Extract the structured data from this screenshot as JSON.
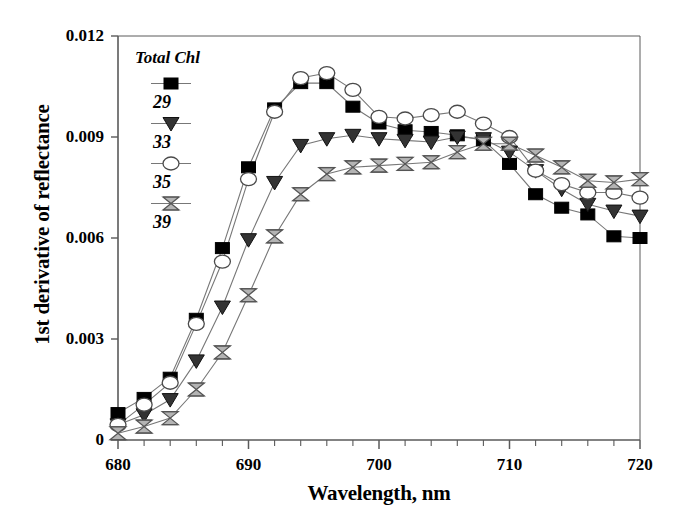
{
  "chart_data": {
    "type": "line",
    "title": "",
    "xlabel": "Wavelength, nm",
    "ylabel": "1st derivative of reflectance",
    "xlim": [
      680,
      720
    ],
    "ylim": [
      0,
      0.012
    ],
    "xticks": [
      680,
      690,
      700,
      710,
      720
    ],
    "xtick_labels": [
      "680",
      "690",
      "700",
      "710",
      "720"
    ],
    "xminor_step": 2,
    "yticks": [
      0,
      0.003,
      0.006,
      0.009,
      0.012
    ],
    "ytick_labels": [
      "0",
      "0.003",
      "0.006",
      "0.009",
      "0.012"
    ],
    "grid": false,
    "legend_position": "upper-left-inside",
    "legend_title": "Total Chl",
    "x": [
      680,
      682,
      684,
      686,
      688,
      690,
      692,
      694,
      696,
      698,
      700,
      702,
      704,
      706,
      708,
      710,
      712,
      714,
      716,
      718,
      720
    ],
    "series": [
      {
        "name": "29",
        "label": "29",
        "marker": "filled-square",
        "color": "#000000",
        "values": [
          0.0008,
          0.00125,
          0.00185,
          0.0036,
          0.0057,
          0.0081,
          0.00985,
          0.0106,
          0.0106,
          0.0099,
          0.0094,
          0.0092,
          0.00915,
          0.00905,
          0.0089,
          0.0082,
          0.0073,
          0.0069,
          0.0067,
          0.00605,
          0.006
        ]
      },
      {
        "name": "33",
        "label": "33",
        "marker": "filled-triangle-down",
        "color": "#000000",
        "values": [
          0.00045,
          0.00075,
          0.0012,
          0.00235,
          0.00395,
          0.00595,
          0.00765,
          0.00875,
          0.00895,
          0.00905,
          0.00895,
          0.0089,
          0.00885,
          0.009,
          0.00895,
          0.00855,
          0.008,
          0.00745,
          0.007,
          0.0068,
          0.00665
        ]
      },
      {
        "name": "35",
        "label": "35",
        "marker": "open-circle",
        "color": "#000000",
        "values": [
          0.00045,
          0.00105,
          0.0017,
          0.00345,
          0.0053,
          0.00775,
          0.00975,
          0.01075,
          0.0109,
          0.0104,
          0.0096,
          0.00955,
          0.00965,
          0.00975,
          0.0094,
          0.009,
          0.008,
          0.0076,
          0.00735,
          0.00735,
          0.0072
        ]
      },
      {
        "name": "39",
        "label": "39",
        "marker": "bowtie",
        "color": "#000000",
        "values": [
          0.0002,
          0.0004,
          0.00065,
          0.0015,
          0.0026,
          0.0043,
          0.00605,
          0.0073,
          0.0079,
          0.0081,
          0.00815,
          0.0082,
          0.00825,
          0.00855,
          0.0088,
          0.0088,
          0.00845,
          0.0081,
          0.0077,
          0.00765,
          0.00775
        ]
      }
    ]
  },
  "axis": {
    "xlabel": "Wavelength, nm",
    "ylabel": "1st derivative of reflectance"
  },
  "legend": {
    "title": "Total Chl",
    "entries": [
      {
        "label": "29"
      },
      {
        "label": "33"
      },
      {
        "label": "35"
      },
      {
        "label": "39"
      }
    ]
  }
}
